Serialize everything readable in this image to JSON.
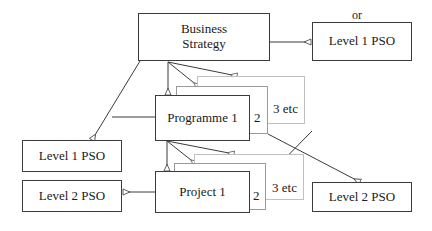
{
  "diagram": {
    "line_color": "#3b3b3b",
    "faint_line_color": "#b4b4b4",
    "text_color": "#1a1a1a",
    "background": "#ffffff"
  },
  "nodes": {
    "business_strategy": {
      "label": "Business\nStrategy",
      "line1": "Business",
      "line2": "Strategy"
    },
    "level1_pso_top": {
      "label": "Level 1 PSO"
    },
    "programme1": {
      "label": "Programme 1"
    },
    "level1_pso_left": {
      "label": "Level 1 PSO"
    },
    "project1": {
      "label": "Project 1"
    },
    "level2_pso_left": {
      "label": "Level 2 PSO"
    },
    "level2_pso_right": {
      "label": "Level 2 PSO"
    }
  },
  "labels": {
    "or": "or",
    "programme_stack_2": "2",
    "programme_stack_3": "3 etc",
    "project_stack_2": "2",
    "project_stack_3": "3 etc"
  }
}
